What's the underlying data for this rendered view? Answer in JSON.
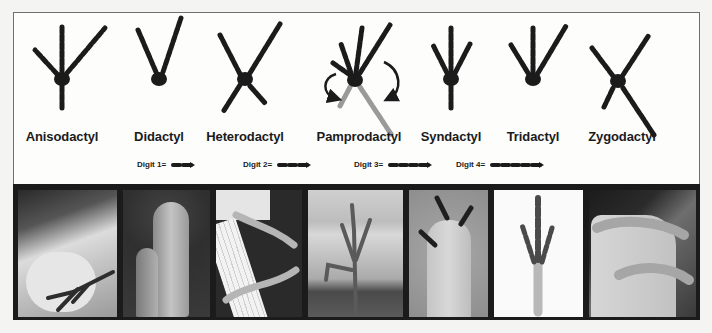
{
  "figure": {
    "foot_types": [
      {
        "label": "Anisodactyl",
        "x": 62
      },
      {
        "label": "Didactyl",
        "x": 159
      },
      {
        "label": "Heterodactyl",
        "x": 245
      },
      {
        "label": "Pamprodactyl",
        "x": 359
      },
      {
        "label": "Syndactyl",
        "x": 451
      },
      {
        "label": "Tridactyl",
        "x": 533
      },
      {
        "label": "Zygodactyl",
        "x": 622
      }
    ],
    "legend": [
      {
        "label": "Digit 1=",
        "segments": 2,
        "x": 137
      },
      {
        "label": "Digit 2=",
        "segments": 3,
        "x": 243
      },
      {
        "label": "Digit 3=",
        "segments": 4,
        "x": 354
      },
      {
        "label": "Digit 4=",
        "segments": 5,
        "x": 456
      }
    ],
    "photos": [
      {
        "name": "anisodactyl-photo",
        "desc": "bird foot gripping a finger"
      },
      {
        "name": "didactyl-photo",
        "desc": "ostrich two-toed foot"
      },
      {
        "name": "heterodactyl-photo",
        "desc": "trogon foot on white perch"
      },
      {
        "name": "pamprodactyl-photo",
        "desc": "swift foot on wood"
      },
      {
        "name": "syndactyl-photo",
        "desc": "kingfisher fused toes"
      },
      {
        "name": "tridactyl-photo",
        "desc": "three-toed foot x-ray"
      },
      {
        "name": "zygodactyl-photo",
        "desc": "parrot foot on finger"
      }
    ],
    "colors": {
      "ink": "#1b1b1b",
      "reversible_toe": "#9a9a9a",
      "strip": "#1b1b1b",
      "border": "#6f6f6f"
    }
  }
}
